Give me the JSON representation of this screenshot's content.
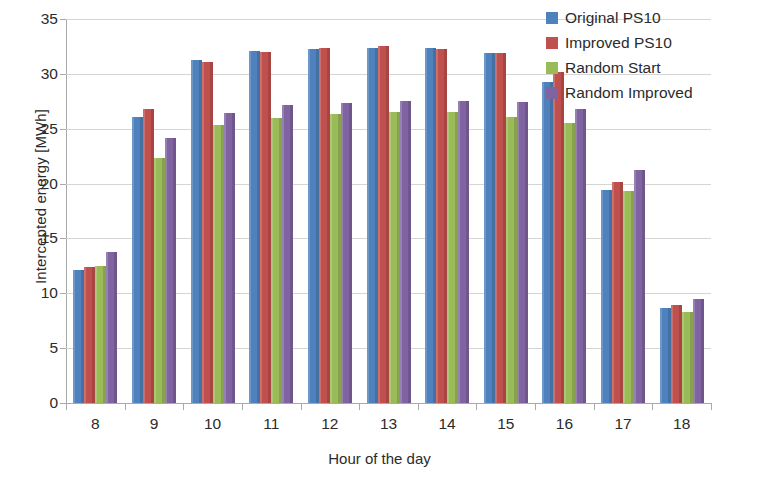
{
  "chart_data": {
    "type": "bar",
    "title": "",
    "xlabel": "Hour of the day",
    "ylabel": "Intercepted energy [MWh]",
    "categories": [
      "8",
      "9",
      "10",
      "11",
      "12",
      "13",
      "14",
      "15",
      "16",
      "17",
      "18"
    ],
    "ylim": [
      0,
      35
    ],
    "yticks": [
      0,
      5,
      10,
      15,
      20,
      25,
      30,
      35
    ],
    "ytick_labels": [
      "0",
      "5",
      "10",
      "15",
      "20",
      "25",
      "30",
      "35"
    ],
    "grid": true,
    "legend_position": "top-right",
    "series": [
      {
        "name": "Original PS10",
        "color": "#4f81bd",
        "values": [
          12.1,
          26.1,
          31.3,
          32.1,
          32.3,
          32.4,
          32.4,
          31.9,
          29.3,
          19.4,
          8.7
        ]
      },
      {
        "name": "Improved PS10",
        "color": "#c0504d",
        "values": [
          12.4,
          26.8,
          31.1,
          32.0,
          32.4,
          32.5,
          32.3,
          31.9,
          30.2,
          20.1,
          8.9
        ]
      },
      {
        "name": "Random Start",
        "color": "#9bbb59",
        "values": [
          12.5,
          22.3,
          25.3,
          26.0,
          26.3,
          26.5,
          26.5,
          26.1,
          25.5,
          19.3,
          8.3
        ]
      },
      {
        "name": "Random Improved",
        "color": "#8064a2",
        "values": [
          13.8,
          24.2,
          26.4,
          27.2,
          27.3,
          27.5,
          27.5,
          27.4,
          26.8,
          21.2,
          9.5
        ]
      }
    ]
  }
}
